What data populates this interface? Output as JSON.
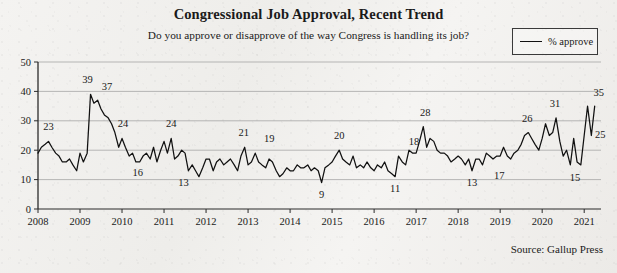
{
  "header": {
    "title": "Congressional Job Approval, Recent Trend",
    "subtitle": "Do you approve or disapprove of the way Congress is handling its job?"
  },
  "legend": {
    "label": "% approve",
    "swatch_name": "line-swatch"
  },
  "source": {
    "text": "Source: Gallup Press"
  },
  "chart_data": {
    "type": "line",
    "title": "Congressional Job Approval, Recent Trend",
    "subtitle": "Do you approve or disapprove of the way Congress is handling its job?",
    "xlabel": "",
    "ylabel": "",
    "ylim": [
      0,
      50
    ],
    "xlim": [
      2008,
      2021.4
    ],
    "grid": true,
    "legend_position": "top-right",
    "y_ticks": [
      "0",
      "10",
      "20",
      "30",
      "40",
      "50"
    ],
    "y_tick_values": [
      0,
      10,
      20,
      30,
      40,
      50
    ],
    "x_ticks": [
      "2008",
      "2009",
      "2010",
      "2011",
      "2012",
      "2013",
      "2014",
      "2015",
      "2016",
      "2017",
      "2018",
      "2019",
      "2020",
      "2021"
    ],
    "x_tick_values": [
      2008,
      2009,
      2010,
      2011,
      2012,
      2013,
      2014,
      2015,
      2016,
      2017,
      2018,
      2019,
      2020,
      2021
    ],
    "series": [
      {
        "name": "% approve",
        "color": "#111111",
        "x": [
          2008.0,
          2008.08,
          2008.17,
          2008.25,
          2008.33,
          2008.42,
          2008.5,
          2008.58,
          2008.67,
          2008.75,
          2008.83,
          2008.92,
          2009.0,
          2009.08,
          2009.17,
          2009.25,
          2009.33,
          2009.42,
          2009.5,
          2009.58,
          2009.67,
          2009.75,
          2009.83,
          2009.92,
          2010.0,
          2010.08,
          2010.17,
          2010.25,
          2010.33,
          2010.42,
          2010.5,
          2010.58,
          2010.67,
          2010.75,
          2010.83,
          2010.92,
          2011.0,
          2011.08,
          2011.17,
          2011.25,
          2011.33,
          2011.42,
          2011.5,
          2011.58,
          2011.67,
          2011.75,
          2011.83,
          2011.92,
          2012.0,
          2012.08,
          2012.17,
          2012.25,
          2012.33,
          2012.42,
          2012.5,
          2012.58,
          2012.67,
          2012.75,
          2012.83,
          2012.92,
          2013.0,
          2013.08,
          2013.17,
          2013.25,
          2013.33,
          2013.42,
          2013.5,
          2013.58,
          2013.67,
          2013.75,
          2013.83,
          2013.92,
          2014.0,
          2014.08,
          2014.17,
          2014.25,
          2014.33,
          2014.42,
          2014.5,
          2014.58,
          2014.67,
          2014.75,
          2014.83,
          2014.92,
          2015.0,
          2015.08,
          2015.17,
          2015.25,
          2015.33,
          2015.42,
          2015.5,
          2015.58,
          2015.67,
          2015.75,
          2015.83,
          2015.92,
          2016.0,
          2016.08,
          2016.17,
          2016.25,
          2016.33,
          2016.42,
          2016.5,
          2016.58,
          2016.67,
          2016.75,
          2016.83,
          2016.92,
          2017.0,
          2017.08,
          2017.17,
          2017.25,
          2017.33,
          2017.42,
          2017.5,
          2017.58,
          2017.67,
          2017.75,
          2017.83,
          2017.92,
          2018.0,
          2018.08,
          2018.17,
          2018.25,
          2018.33,
          2018.42,
          2018.5,
          2018.58,
          2018.67,
          2018.75,
          2018.83,
          2018.92,
          2019.0,
          2019.08,
          2019.17,
          2019.25,
          2019.33,
          2019.42,
          2019.5,
          2019.58,
          2019.67,
          2019.75,
          2019.83,
          2019.92,
          2020.0,
          2020.08,
          2020.17,
          2020.25,
          2020.33,
          2020.42,
          2020.5,
          2020.58,
          2020.67,
          2020.75,
          2020.83,
          2020.92,
          2021.0,
          2021.08,
          2021.17,
          2021.25
        ],
        "y": [
          19,
          21,
          22,
          23,
          21,
          19,
          18,
          16,
          16,
          17,
          15,
          13,
          19,
          16,
          19,
          39,
          36,
          37,
          34,
          32,
          31,
          29,
          26,
          21,
          24,
          21,
          18,
          19,
          16,
          16,
          18,
          19,
          17,
          21,
          16,
          20,
          23,
          19,
          24,
          17,
          18,
          20,
          19,
          13,
          15,
          13,
          11,
          14,
          17,
          17,
          13,
          16,
          17,
          15,
          16,
          17,
          15,
          13,
          18,
          21,
          15,
          16,
          19,
          16,
          15,
          14,
          17,
          16,
          13,
          11,
          12,
          14,
          13,
          13,
          15,
          14,
          14,
          15,
          13,
          14,
          13,
          9,
          14,
          15,
          16,
          18,
          20,
          17,
          16,
          15,
          18,
          14,
          15,
          14,
          16,
          14,
          13,
          15,
          14,
          16,
          13,
          12,
          11,
          18,
          16,
          15,
          20,
          19,
          19,
          23,
          28,
          21,
          24,
          23,
          20,
          19,
          19,
          18,
          16,
          17,
          18,
          17,
          15,
          17,
          13,
          17,
          17,
          15,
          19,
          18,
          17,
          18,
          18,
          21,
          18,
          17,
          19,
          20,
          22,
          25,
          26,
          24,
          22,
          20,
          24,
          29,
          25,
          26,
          31,
          23,
          18,
          20,
          15,
          24,
          16,
          15,
          25,
          35,
          25,
          35
        ]
      }
    ],
    "annotations": [
      {
        "label": "23",
        "x": 2008.25,
        "y": 23,
        "dx": 0,
        "dy": -11
      },
      {
        "label": "39",
        "x": 2009.25,
        "y": 39,
        "dx": -3,
        "dy": -11
      },
      {
        "label": "37",
        "x": 2009.5,
        "y": 37,
        "dx": 6,
        "dy": -10
      },
      {
        "label": "24",
        "x": 2010.0,
        "y": 24,
        "dx": 1,
        "dy": -11
      },
      {
        "label": "16",
        "x": 2010.42,
        "y": 16,
        "dx": -2,
        "dy": 14
      },
      {
        "label": "24",
        "x": 2011.17,
        "y": 24,
        "dx": 0,
        "dy": -11
      },
      {
        "label": "13",
        "x": 2011.58,
        "y": 13,
        "dx": -5,
        "dy": 15
      },
      {
        "label": "21",
        "x": 2012.92,
        "y": 21,
        "dx": -1,
        "dy": -11
      },
      {
        "label": "19",
        "x": 2013.17,
        "y": 19,
        "dx": 14,
        "dy": -11
      },
      {
        "label": "9",
        "x": 2014.75,
        "y": 9,
        "dx": 0,
        "dy": 15
      },
      {
        "label": "20",
        "x": 2015.17,
        "y": 20,
        "dx": 0,
        "dy": -11
      },
      {
        "label": "11",
        "x": 2016.5,
        "y": 11,
        "dx": 0,
        "dy": 15
      },
      {
        "label": "18",
        "x": 2017.0,
        "y": 18,
        "dx": -2,
        "dy": -11
      },
      {
        "label": "28",
        "x": 2017.17,
        "y": 28,
        "dx": 2,
        "dy": -11
      },
      {
        "label": "13",
        "x": 2018.33,
        "y": 13,
        "dx": 0,
        "dy": 15
      },
      {
        "label": "26",
        "x": 2019.67,
        "y": 26,
        "dx": -1,
        "dy": -11
      },
      {
        "label": "17",
        "x": 2019.0,
        "y": 17,
        "dx": -1,
        "dy": 20
      },
      {
        "label": "31",
        "x": 2020.33,
        "y": 31,
        "dx": -1,
        "dy": -11
      },
      {
        "label": "15",
        "x": 2020.83,
        "y": 15,
        "dx": -2,
        "dy": 16
      },
      {
        "label": "35",
        "x": 2021.25,
        "y": 35,
        "dx": 4,
        "dy": -10
      },
      {
        "label": "25",
        "x": 2021.17,
        "y": 25,
        "dx": 9,
        "dy": 2
      }
    ]
  }
}
